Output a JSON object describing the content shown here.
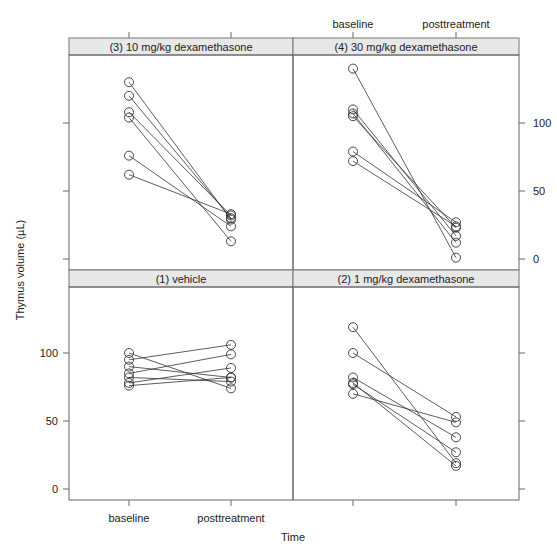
{
  "chart_data": {
    "type": "line",
    "title": "",
    "xlabel": "Time",
    "ylabel": "Thymus volume (µL)",
    "categories": [
      "baseline",
      "posttreatment"
    ],
    "ylim": [
      -8,
      150
    ],
    "yticks": [
      0,
      50,
      100
    ],
    "grid": false,
    "layout": "2x2 lattice panels, paired subject lines with open circle markers",
    "panels": [
      {
        "id": "p3",
        "label": "(3) 10 mg/kg dexamethasone",
        "position": "top-left",
        "subjects": [
          [
            130,
            29
          ],
          [
            120,
            30
          ],
          [
            108,
            32
          ],
          [
            104,
            13
          ],
          [
            76,
            24
          ],
          [
            62,
            33
          ]
        ]
      },
      {
        "id": "p4",
        "label": "(4) 30 mg/kg dexamethasone",
        "position": "top-right",
        "subjects": [
          [
            140,
            1
          ],
          [
            110,
            17
          ],
          [
            107,
            12
          ],
          [
            105,
            23
          ],
          [
            79,
            27
          ],
          [
            72,
            24
          ]
        ]
      },
      {
        "id": "p1",
        "label": "(1) vehicle",
        "position": "bottom-left",
        "subjects": [
          [
            100,
            74
          ],
          [
            95,
            106
          ],
          [
            90,
            82
          ],
          [
            85,
            99
          ],
          [
            82,
            79
          ],
          [
            78,
            89
          ],
          [
            76,
            82
          ]
        ]
      },
      {
        "id": "p2",
        "label": "(2) 1 mg/kg dexamethasone",
        "position": "bottom-right",
        "subjects": [
          [
            119,
            19
          ],
          [
            100,
            53
          ],
          [
            82,
            38
          ],
          [
            78,
            17
          ],
          [
            77,
            27
          ],
          [
            70,
            49
          ]
        ]
      }
    ]
  },
  "axes": {
    "xlabel": "Time",
    "ylabel": "Thymus volume (µL)",
    "x_tick_baseline": "baseline",
    "x_tick_post": "posttreatment",
    "y_ticks": [
      "0",
      "50",
      "100"
    ]
  },
  "colors": {
    "strip": "#e8e8e8",
    "line": "#333333",
    "frame": "#666666"
  }
}
